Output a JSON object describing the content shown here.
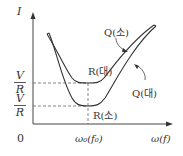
{
  "diagram": {
    "y_axis_label": "I",
    "x_axis_label": "ω(f)",
    "origin_label": "0",
    "resonance_label": "ω₀(f₀)",
    "y_ticks": [
      {
        "numerator": "V",
        "denominator": "R",
        "level": "upper"
      },
      {
        "numerator": "V",
        "denominator": "R",
        "level": "lower"
      }
    ],
    "curves": [
      {
        "name": "inner",
        "label_R": "R(대)",
        "label_Q": "Q(소)"
      },
      {
        "name": "outer",
        "label_R": "R(소)",
        "label_Q": "Q(대)"
      }
    ],
    "colors": {
      "line": "#333333",
      "dashed": "#555555"
    }
  }
}
